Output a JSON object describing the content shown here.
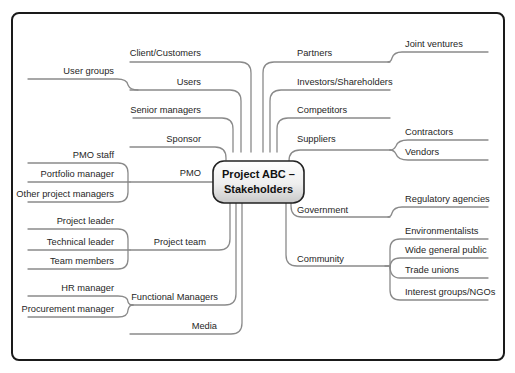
{
  "diagram": {
    "type": "mind-map",
    "center": {
      "line1": "Project ABC –",
      "line2": "Stakeholders"
    },
    "left_branches": [
      {
        "label": "Client/Customers",
        "children": []
      },
      {
        "label": "Users",
        "children": [
          "User groups"
        ]
      },
      {
        "label": "Senior managers",
        "children": []
      },
      {
        "label": "Sponsor",
        "children": []
      },
      {
        "label": "PMO",
        "children": [
          "PMO staff",
          "Portfolio manager",
          "Other project managers"
        ]
      },
      {
        "label": "Project team",
        "children": [
          "Project leader",
          "Technical leader",
          "Team members"
        ]
      },
      {
        "label": "Functional Managers",
        "children": [
          "HR manager",
          "Procurement manager"
        ]
      },
      {
        "label": "Media",
        "children": []
      }
    ],
    "right_branches": [
      {
        "label": "Partners",
        "children": [
          "Joint ventures"
        ]
      },
      {
        "label": "Investors/Shareholders",
        "children": []
      },
      {
        "label": "Competitors",
        "children": []
      },
      {
        "label": "Suppliers",
        "children": [
          "Contractors",
          "Vendors"
        ]
      },
      {
        "label": "Government",
        "children": [
          "Regulatory agencies"
        ]
      },
      {
        "label": "Community",
        "children": [
          "Environmentalists",
          "Wide general public",
          "Trade unions",
          "Interest groups/NGOs"
        ]
      }
    ]
  },
  "colors": {
    "frame_border": "#1a1a1a",
    "branch_line": "#8a8a8a",
    "center_fill_top": "#ffffff",
    "center_fill_bottom": "#d6d6d6",
    "text": "#262626"
  }
}
